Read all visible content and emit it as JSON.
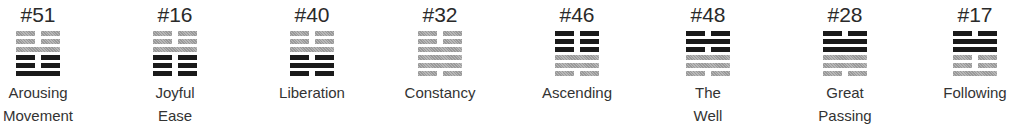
{
  "hexagrams": [
    {
      "number": "#51",
      "name_line1": "Arousing",
      "name_line2": "Movement",
      "center_x": 38,
      "upper": {
        "color": "gray",
        "lines": [
          "broken",
          "broken",
          "solid"
        ]
      },
      "lower": {
        "color": "black",
        "lines": [
          "broken",
          "broken",
          "solid"
        ]
      }
    },
    {
      "number": "#16",
      "name_line1": "Joyful",
      "name_line2": "Ease",
      "center_x": 175,
      "upper": {
        "color": "gray",
        "lines": [
          "broken",
          "broken",
          "solid"
        ]
      },
      "lower": {
        "color": "black",
        "lines": [
          "broken",
          "broken",
          "broken"
        ]
      }
    },
    {
      "number": "#40",
      "name_line1": "Liberation",
      "name_line2": "",
      "center_x": 312,
      "upper": {
        "color": "gray",
        "lines": [
          "broken",
          "broken",
          "solid"
        ]
      },
      "lower": {
        "color": "black",
        "lines": [
          "broken",
          "solid",
          "broken"
        ]
      }
    },
    {
      "number": "#32",
      "name_line1": "Constancy",
      "name_line2": "",
      "center_x": 440,
      "upper": {
        "color": "gray",
        "lines": [
          "broken",
          "broken",
          "solid"
        ]
      },
      "lower": {
        "color": "gray",
        "lines": [
          "solid",
          "solid",
          "broken"
        ]
      }
    },
    {
      "number": "#46",
      "name_line1": "Ascending",
      "name_line2": "",
      "center_x": 577,
      "upper": {
        "color": "black",
        "lines": [
          "broken",
          "broken",
          "broken"
        ]
      },
      "lower": {
        "color": "gray",
        "lines": [
          "solid",
          "solid",
          "broken"
        ]
      }
    },
    {
      "number": "#48",
      "name_line1": "The",
      "name_line2": "Well",
      "center_x": 708,
      "upper": {
        "color": "black",
        "lines": [
          "broken",
          "solid",
          "broken"
        ]
      },
      "lower": {
        "color": "gray",
        "lines": [
          "solid",
          "solid",
          "broken"
        ]
      }
    },
    {
      "number": "#28",
      "name_line1": "Great",
      "name_line2": "Passing",
      "center_x": 845,
      "upper": {
        "color": "black",
        "lines": [
          "broken",
          "solid",
          "solid"
        ]
      },
      "lower": {
        "color": "gray",
        "lines": [
          "solid",
          "solid",
          "broken"
        ]
      }
    },
    {
      "number": "#17",
      "name_line1": "Following",
      "name_line2": "",
      "center_x": 975,
      "upper": {
        "color": "black",
        "lines": [
          "broken",
          "solid",
          "solid"
        ]
      },
      "lower": {
        "color": "gray",
        "lines": [
          "broken",
          "broken",
          "solid"
        ]
      }
    }
  ],
  "colors": {
    "black_line": "#1a1a1a",
    "gray_line": "#a8a8a8",
    "text": "#2b2b2b"
  }
}
